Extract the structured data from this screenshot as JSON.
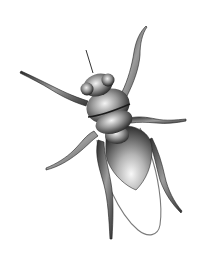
{
  "image": {
    "subject": "fly",
    "style": "grayscale 3D-shaded illustration",
    "width": 201,
    "height": 256,
    "background": "#ffffff",
    "colors": {
      "dark": "#1a1a1a",
      "mid": "#6e6e6e",
      "light": "#e6e6e6",
      "wing_outline": "#7a7a7a"
    },
    "parts": [
      "antenna",
      "head",
      "eyes",
      "thorax",
      "waist",
      "abdomen",
      "wing",
      "legs"
    ]
  }
}
